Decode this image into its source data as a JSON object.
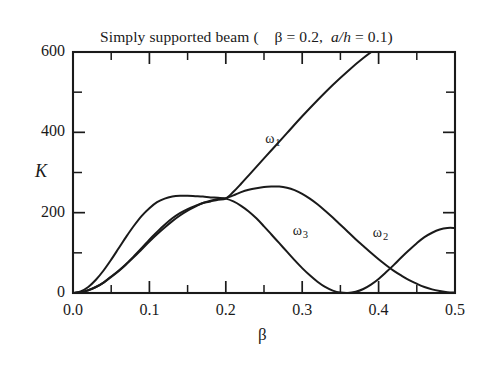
{
  "chart_data": {
    "type": "line",
    "title": "Simply supported beam (    β = 0.2,  a/h = 0.1)",
    "title_parts": {
      "main": "Simply supported beam (",
      "param1": "β = 0.2,",
      "param2_italic": "a/h",
      "param2_rest": "= 0.1)"
    },
    "xlabel": "β",
    "ylabel": "K",
    "xlim": [
      0.0,
      0.5
    ],
    "ylim": [
      0,
      600
    ],
    "grid": false,
    "legend": "inline-labels",
    "xticks": [
      "0.0",
      "0.1",
      "0.2",
      "0.3",
      "0.4",
      "0.5"
    ],
    "xtick_values": [
      0.0,
      0.1,
      0.2,
      0.3,
      0.4,
      0.5
    ],
    "xminor_values": [
      0.05,
      0.15,
      0.25,
      0.35,
      0.45
    ],
    "yticks": [
      "0",
      "200",
      "400",
      "600"
    ],
    "ytick_values": [
      0,
      200,
      400,
      600
    ],
    "yminor_values": [
      100,
      300,
      500
    ],
    "series": [
      {
        "name": "ω₁",
        "label": "ω",
        "sub": "1",
        "label_x": 0.2515,
        "label_y": 382,
        "points": [
          [
            0.0,
            0
          ],
          [
            0.01,
            2
          ],
          [
            0.02,
            7
          ],
          [
            0.03,
            15
          ],
          [
            0.04,
            26
          ],
          [
            0.05,
            41
          ],
          [
            0.06,
            56
          ],
          [
            0.07,
            73
          ],
          [
            0.08,
            92
          ],
          [
            0.09,
            112
          ],
          [
            0.1,
            133
          ],
          [
            0.11,
            152
          ],
          [
            0.12,
            170
          ],
          [
            0.13,
            186
          ],
          [
            0.14,
            199
          ],
          [
            0.15,
            209
          ],
          [
            0.16,
            217
          ],
          [
            0.17,
            224
          ],
          [
            0.18,
            228
          ],
          [
            0.19,
            232
          ],
          [
            0.2,
            235
          ],
          [
            0.21,
            252
          ],
          [
            0.22,
            272
          ],
          [
            0.23,
            293
          ],
          [
            0.24,
            314
          ],
          [
            0.25,
            335
          ],
          [
            0.26,
            356
          ],
          [
            0.28,
            398
          ],
          [
            0.3,
            440
          ],
          [
            0.32,
            480
          ],
          [
            0.34,
            518
          ],
          [
            0.36,
            553
          ],
          [
            0.38,
            585
          ],
          [
            0.4,
            613
          ],
          [
            0.42,
            637
          ],
          [
            0.43,
            648
          ]
        ]
      },
      {
        "name": "ω₂",
        "label": "ω",
        "sub": "2",
        "label_x": 0.3925,
        "label_y": 148,
        "points": [
          [
            0.0,
            0
          ],
          [
            0.01,
            2
          ],
          [
            0.02,
            7
          ],
          [
            0.03,
            15
          ],
          [
            0.04,
            26
          ],
          [
            0.05,
            40
          ],
          [
            0.06,
            55
          ],
          [
            0.07,
            72
          ],
          [
            0.08,
            90
          ],
          [
            0.09,
            109
          ],
          [
            0.1,
            128
          ],
          [
            0.11,
            146
          ],
          [
            0.12,
            163
          ],
          [
            0.13,
            179
          ],
          [
            0.14,
            193
          ],
          [
            0.15,
            205
          ],
          [
            0.16,
            215
          ],
          [
            0.17,
            224
          ],
          [
            0.18,
            230
          ],
          [
            0.19,
            234
          ],
          [
            0.2,
            236
          ],
          [
            0.21,
            243
          ],
          [
            0.22,
            251
          ],
          [
            0.23,
            257
          ],
          [
            0.24,
            261
          ],
          [
            0.25,
            264
          ],
          [
            0.26,
            265
          ],
          [
            0.27,
            265
          ],
          [
            0.28,
            262
          ],
          [
            0.29,
            256
          ],
          [
            0.3,
            247
          ],
          [
            0.31,
            235
          ],
          [
            0.32,
            221
          ],
          [
            0.33,
            205
          ],
          [
            0.34,
            188
          ],
          [
            0.35,
            170
          ],
          [
            0.36,
            152
          ],
          [
            0.37,
            134
          ],
          [
            0.38,
            117
          ],
          [
            0.39,
            100
          ],
          [
            0.4,
            84
          ],
          [
            0.41,
            69
          ],
          [
            0.42,
            55
          ],
          [
            0.43,
            43
          ],
          [
            0.44,
            32
          ],
          [
            0.45,
            23
          ],
          [
            0.46,
            15
          ],
          [
            0.47,
            9
          ],
          [
            0.48,
            5
          ],
          [
            0.49,
            2
          ],
          [
            0.5,
            1
          ]
        ]
      },
      {
        "name": "ω₃",
        "label": "ω",
        "sub": "3",
        "label_x": 0.2875,
        "label_y": 151,
        "points": [
          [
            0.0,
            0
          ],
          [
            0.01,
            4
          ],
          [
            0.02,
            15
          ],
          [
            0.03,
            33
          ],
          [
            0.04,
            56
          ],
          [
            0.05,
            83
          ],
          [
            0.06,
            112
          ],
          [
            0.07,
            141
          ],
          [
            0.08,
            168
          ],
          [
            0.09,
            192
          ],
          [
            0.1,
            211
          ],
          [
            0.11,
            226
          ],
          [
            0.12,
            235
          ],
          [
            0.13,
            240
          ],
          [
            0.14,
            242
          ],
          [
            0.15,
            242
          ],
          [
            0.16,
            241
          ],
          [
            0.17,
            240
          ],
          [
            0.18,
            238
          ],
          [
            0.19,
            237
          ],
          [
            0.2,
            235
          ],
          [
            0.21,
            228
          ],
          [
            0.22,
            217
          ],
          [
            0.23,
            203
          ],
          [
            0.24,
            186
          ],
          [
            0.25,
            166
          ],
          [
            0.26,
            145
          ],
          [
            0.27,
            124
          ],
          [
            0.28,
            103
          ],
          [
            0.29,
            82
          ],
          [
            0.3,
            62
          ],
          [
            0.31,
            44
          ],
          [
            0.32,
            28
          ],
          [
            0.33,
            15
          ],
          [
            0.34,
            6
          ],
          [
            0.35,
            1
          ],
          [
            0.36,
            0
          ],
          [
            0.37,
            3
          ],
          [
            0.38,
            10
          ],
          [
            0.39,
            21
          ],
          [
            0.4,
            35
          ],
          [
            0.41,
            52
          ],
          [
            0.42,
            70
          ],
          [
            0.43,
            89
          ],
          [
            0.44,
            107
          ],
          [
            0.45,
            124
          ],
          [
            0.46,
            139
          ],
          [
            0.47,
            150
          ],
          [
            0.48,
            158
          ],
          [
            0.49,
            162
          ],
          [
            0.5,
            162
          ]
        ]
      }
    ]
  }
}
